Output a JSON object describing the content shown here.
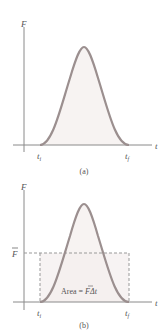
{
  "panels": [
    {
      "id": "a",
      "caption": "(a)",
      "y_label": "F",
      "x_label": "t",
      "t_start_label": "t",
      "t_start_sub": "i",
      "t_end_label": "t",
      "t_end_sub": "f"
    },
    {
      "id": "b",
      "caption": "(b)",
      "y_label": "F",
      "x_label": "t",
      "avg_label": "F",
      "t_start_label": "t",
      "t_start_sub": "i",
      "t_end_label": "t",
      "t_end_sub": "f",
      "area_prefix": "Area = ",
      "area_F": "F",
      "area_suffix": "Δt"
    }
  ],
  "colors": {
    "curve": "#9b8f8f",
    "fill": "#f7f3f2",
    "axis": "#8a8a8a",
    "dashed": "#999999",
    "text": "#555555"
  }
}
